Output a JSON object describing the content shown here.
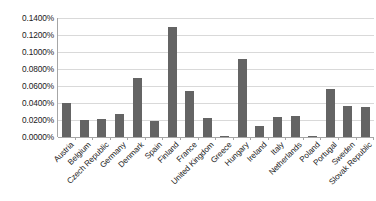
{
  "chart_data": {
    "type": "bar",
    "title": "",
    "subtitle": "",
    "xlabel": "",
    "ylabel": "",
    "ylim": [
      0,
      0.0014
    ],
    "y_tick_labels": [
      "0.1400%",
      "0.1200%",
      "0.1000%",
      "0.0800%",
      "0.0600%",
      "0.0400%",
      "0.0200%",
      "0.0000%"
    ],
    "y_tick_values": [
      0.0014,
      0.0012,
      0.001,
      0.0008,
      0.0006,
      0.0004,
      0.0002,
      0.0
    ],
    "value_format": "percent",
    "grid": true,
    "legend": false,
    "legend_position": "none",
    "bar_color": "#646464",
    "gridline_color": "#d9d9d9",
    "axis_color": "#a6a6a6",
    "background_color": "#ffffff",
    "categories": [
      "Austria",
      "Belgium",
      "Czech Republic",
      "Germany",
      "Denmark",
      "Spain",
      "Finland",
      "France",
      "United Kingdom",
      "Greece",
      "Hungary",
      "Ireland",
      "Italy",
      "Netherlands",
      "Poland",
      "Portugal",
      "Sweden",
      "Slovak Republic"
    ],
    "values": [
      0.04,
      0.02,
      0.021,
      0.0275,
      0.0695,
      0.0185,
      0.13,
      0.0545,
      0.0225,
      0.0015,
      0.092,
      0.0125,
      0.024,
      0.0245,
      0.0005,
      0.0565,
      0.036,
      0.0355
    ],
    "value_labels": [
      "0.0400%",
      "0.0200%",
      "0.0210%",
      "0.0275%",
      "0.0695%",
      "0.0185%",
      "0.1300%",
      "0.0545%",
      "0.0225%",
      "0.0015%",
      "0.0920%",
      "0.0125%",
      "0.0240%",
      "0.0245%",
      "0.0005%",
      "0.0565%",
      "0.0360%",
      "0.0355%"
    ],
    "series": [
      {
        "name": "",
        "values": [
          0.04,
          0.02,
          0.021,
          0.0275,
          0.0695,
          0.0185,
          0.13,
          0.0545,
          0.0225,
          0.0015,
          0.092,
          0.0125,
          0.024,
          0.0245,
          0.0005,
          0.0565,
          0.036,
          0.0355
        ]
      }
    ]
  }
}
